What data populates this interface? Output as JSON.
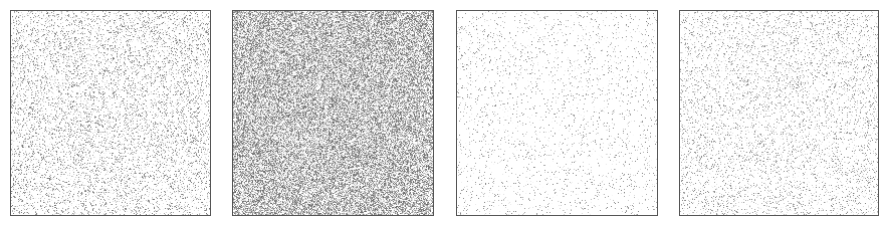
{
  "panels": [
    {
      "id": "panel-1",
      "x": 10,
      "y": 10,
      "w": 201,
      "h": 206,
      "density": 0.22,
      "intensity": 0.55,
      "seed": 11
    },
    {
      "id": "panel-2",
      "x": 232,
      "y": 10,
      "w": 202,
      "h": 206,
      "density": 0.75,
      "intensity": 0.6,
      "seed": 23
    },
    {
      "id": "panel-3",
      "x": 456,
      "y": 10,
      "w": 202,
      "h": 206,
      "density": 0.07,
      "intensity": 0.5,
      "seed": 37
    },
    {
      "id": "panel-4",
      "x": 679,
      "y": 10,
      "w": 200,
      "h": 206,
      "density": 0.16,
      "intensity": 0.5,
      "seed": 51
    }
  ],
  "colors": {
    "border": "#555555",
    "background": "#ffffff",
    "noise": "#808080"
  }
}
